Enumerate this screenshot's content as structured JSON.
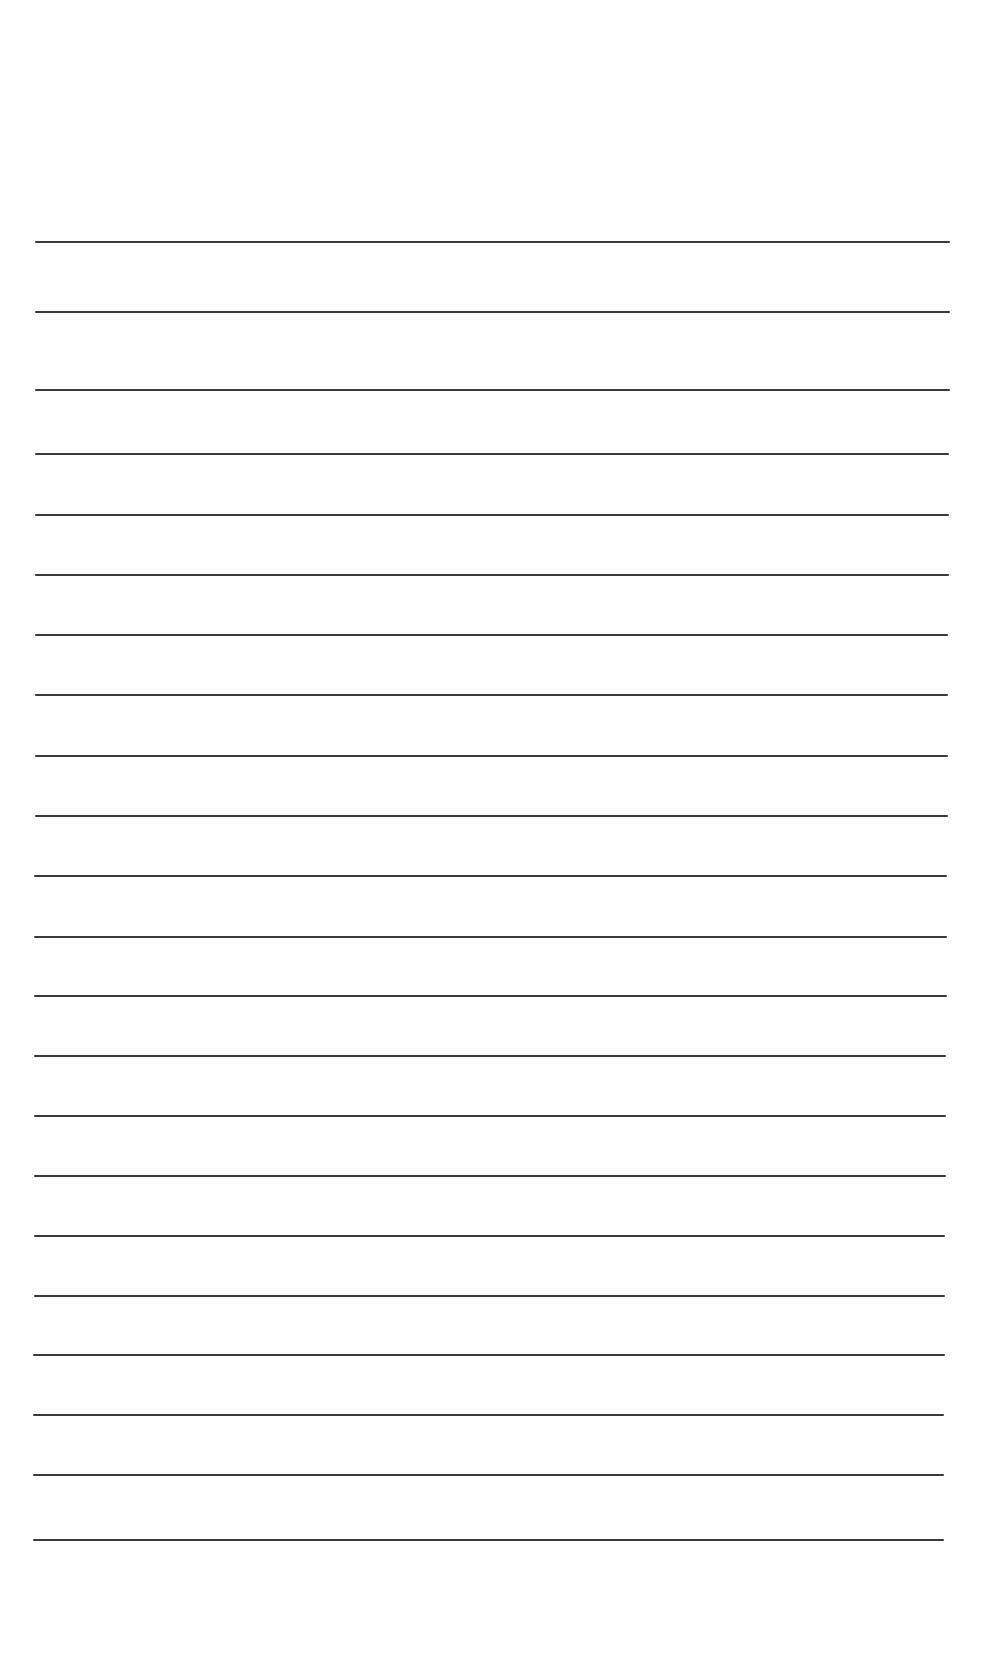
{
  "page": {
    "type": "blank ruled sheet",
    "background_color": "#fefefe",
    "line_color": "#3a3a3a",
    "line_count": 22,
    "lines": [
      {
        "y": 242,
        "x1": 35,
        "x2": 950
      },
      {
        "y": 312,
        "x1": 35,
        "x2": 950
      },
      {
        "y": 390,
        "x1": 35,
        "x2": 950
      },
      {
        "y": 454,
        "x1": 35,
        "x2": 949
      },
      {
        "y": 515,
        "x1": 35,
        "x2": 949
      },
      {
        "y": 575,
        "x1": 35,
        "x2": 949
      },
      {
        "y": 635,
        "x1": 35,
        "x2": 948
      },
      {
        "y": 695,
        "x1": 35,
        "x2": 948
      },
      {
        "y": 756,
        "x1": 35,
        "x2": 948
      },
      {
        "y": 816,
        "x1": 35,
        "x2": 948
      },
      {
        "y": 876,
        "x1": 34,
        "x2": 947
      },
      {
        "y": 937,
        "x1": 34,
        "x2": 947
      },
      {
        "y": 996,
        "x1": 34,
        "x2": 947
      },
      {
        "y": 1056,
        "x1": 34,
        "x2": 946
      },
      {
        "y": 1116,
        "x1": 34,
        "x2": 946
      },
      {
        "y": 1176,
        "x1": 34,
        "x2": 946
      },
      {
        "y": 1236,
        "x1": 34,
        "x2": 945
      },
      {
        "y": 1296,
        "x1": 34,
        "x2": 945
      },
      {
        "y": 1355,
        "x1": 33,
        "x2": 945
      },
      {
        "y": 1415,
        "x1": 33,
        "x2": 944
      },
      {
        "y": 1475,
        "x1": 33,
        "x2": 944
      },
      {
        "y": 1540,
        "x1": 33,
        "x2": 944
      }
    ]
  }
}
